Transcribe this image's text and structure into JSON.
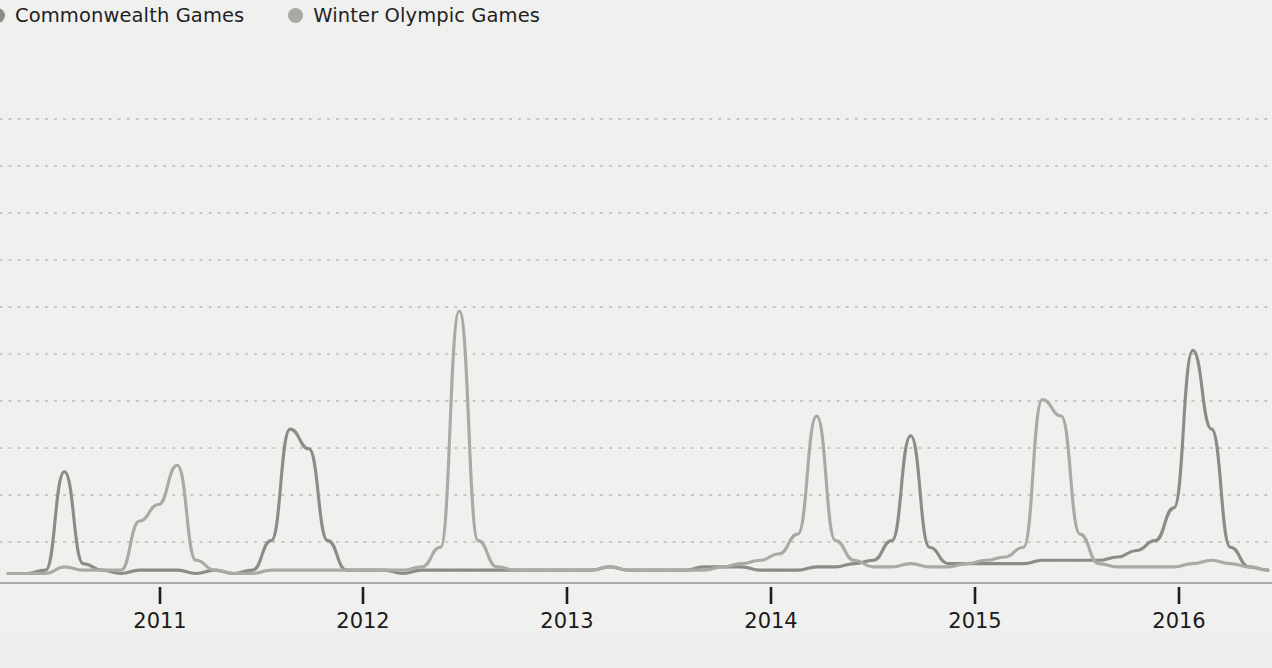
{
  "legend": {
    "position": "top-left",
    "items": [
      {
        "label": "Commonwealth Games",
        "color": "#8b8b88",
        "icon": "legend-dot-icon"
      },
      {
        "label": "Winter Olympic Games",
        "color": "#a9a9a6",
        "icon": "legend-dot-icon"
      }
    ]
  },
  "colors": {
    "background": "#f1f1ef",
    "gridline": "#b9b9b6",
    "axis": "#8f8f8c",
    "tick": "#1d1d1d",
    "text": "#1b1b1b",
    "series_commonwealth": "#8b8b88",
    "series_winter_olympic": "#a9a9a6"
  },
  "axis": {
    "x_tick_labels": [
      "2011",
      "2012",
      "2013",
      "2014",
      "2015",
      "2016"
    ],
    "x_tick_positions_px": [
      160,
      363,
      567,
      771,
      975,
      1179
    ],
    "y_gridline_count": 10,
    "y_gridlines_px": [
      119,
      166,
      213,
      260,
      307,
      354,
      401,
      448,
      495,
      542
    ],
    "baseline_px": 580,
    "grid": true,
    "y_axis_labels_visible": false
  },
  "chart_data": {
    "type": "line",
    "title": "",
    "subtitle": "",
    "xlabel": "",
    "ylabel": "",
    "xlim": [
      "2010-07",
      "2016-02"
    ],
    "ylim": [
      0,
      100
    ],
    "grid": true,
    "legend_position": "top-left",
    "x": [
      "2010-07",
      "2010-08",
      "2010-09",
      "2010-10",
      "2010-11",
      "2010-12",
      "2011-01",
      "2011-02",
      "2011-03",
      "2011-04",
      "2011-05",
      "2011-06",
      "2011-07",
      "2011-08",
      "2011-09",
      "2011-10",
      "2011-11",
      "2011-12",
      "2012-01",
      "2012-02",
      "2012-03",
      "2012-04",
      "2012-05",
      "2012-06",
      "2012-07",
      "2012-08",
      "2012-09",
      "2012-10",
      "2012-11",
      "2012-12",
      "2013-01",
      "2013-02",
      "2013-03",
      "2013-04",
      "2013-05",
      "2013-06",
      "2013-07",
      "2013-08",
      "2013-09",
      "2013-10",
      "2013-11",
      "2013-12",
      "2014-01",
      "2014-02",
      "2014-03",
      "2014-04",
      "2014-05",
      "2014-06",
      "2014-07",
      "2014-08",
      "2014-09",
      "2014-10",
      "2014-11",
      "2014-12",
      "2015-01",
      "2015-02",
      "2015-03",
      "2015-04",
      "2015-05",
      "2015-06",
      "2015-07",
      "2015-08",
      "2015-09",
      "2015-10",
      "2015-11",
      "2015-12",
      "2016-01",
      "2016-02"
    ],
    "series": [
      {
        "name": "Commonwealth Games",
        "color": "#8b8b88",
        "peaks": [
          {
            "label": "Delhi 2010 Commonwealth Games",
            "x": "2010-10",
            "value": 33
          },
          {
            "label": "2011 peak",
            "x": "2011-10",
            "value": 46
          },
          {
            "label": "Glasgow 2014 Commonwealth Games",
            "x": "2014-07",
            "value": 44
          },
          {
            "label": "2015 peak",
            "x": "2015-10",
            "value": 70
          }
        ],
        "values": [
          2,
          2,
          3,
          33,
          5,
          3,
          2,
          3,
          3,
          3,
          2,
          3,
          2,
          3,
          12,
          46,
          40,
          12,
          3,
          3,
          3,
          2,
          3,
          3,
          3,
          3,
          3,
          3,
          3,
          3,
          3,
          3,
          4,
          3,
          3,
          3,
          3,
          4,
          4,
          4,
          3,
          3,
          3,
          4,
          4,
          5,
          6,
          12,
          44,
          10,
          5,
          5,
          5,
          5,
          5,
          6,
          6,
          6,
          6,
          7,
          9,
          12,
          22,
          70,
          46,
          10,
          4,
          3
        ]
      },
      {
        "name": "Winter Olympic Games",
        "color": "#a9a9a6",
        "peaks": [
          {
            "label": "2011 peak",
            "x": "2011-03",
            "value": 35
          },
          {
            "label": "London 2012 peak",
            "x": "2012-07",
            "value": 82
          },
          {
            "label": "Sochi 2014 Winter Olympics",
            "x": "2014-02",
            "value": 50
          },
          {
            "label": "2015 peak",
            "x": "2015-02",
            "value": 55
          }
        ],
        "values": [
          2,
          2,
          2,
          4,
          3,
          3,
          3,
          18,
          23,
          35,
          6,
          3,
          2,
          2,
          3,
          3,
          3,
          3,
          3,
          3,
          3,
          3,
          4,
          10,
          82,
          12,
          4,
          3,
          3,
          3,
          3,
          3,
          4,
          3,
          3,
          3,
          3,
          3,
          4,
          5,
          6,
          8,
          14,
          50,
          12,
          6,
          4,
          4,
          5,
          4,
          4,
          5,
          6,
          7,
          10,
          55,
          50,
          14,
          5,
          4,
          4,
          4,
          4,
          5,
          6,
          5,
          4,
          3
        ]
      }
    ]
  }
}
